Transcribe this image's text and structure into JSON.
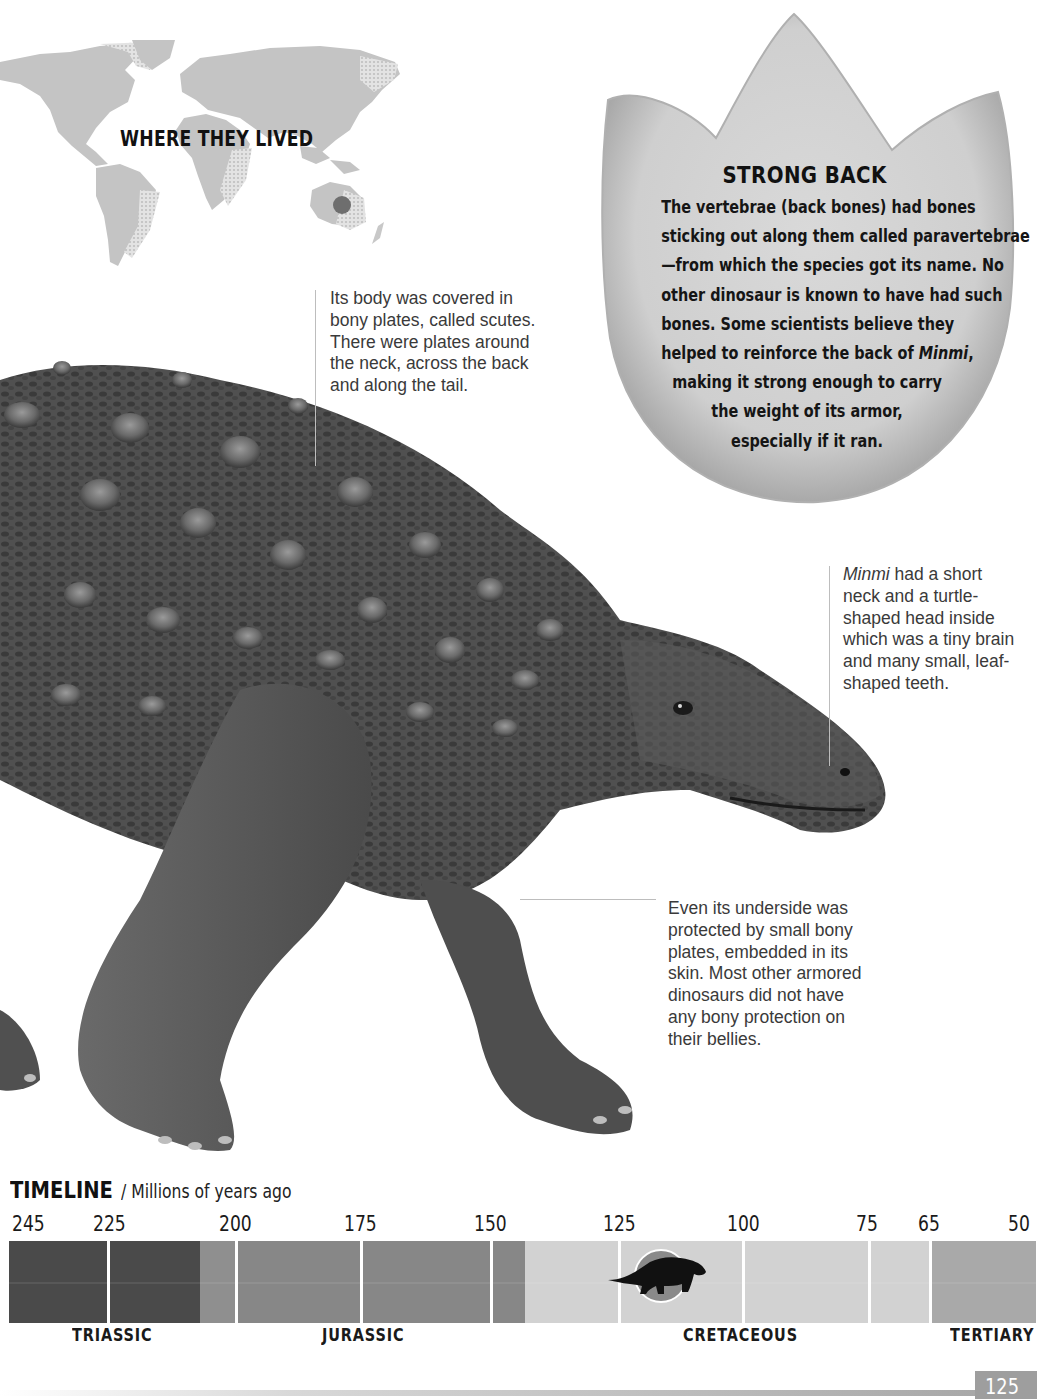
{
  "map": {
    "title": "WHERE THEY LIVED",
    "marker_region": "Australia",
    "marker_color": "#6e6e6e",
    "land_color": "#c4c4c4"
  },
  "strong_back": {
    "title": "STRONG BACK",
    "lines": [
      "The vertebrae (back bones) had bones",
      "sticking out along them called paravertebrae",
      "—from which the species got its name. No",
      "other dinosaur is known to have had such",
      "bones. Some scientists believe they",
      "helped to reinforce the back of ",
      "making it strong enough to carry",
      "the weight of its armor,",
      "especially if it ran."
    ],
    "italic_name": "Minmi",
    "italic_suffix": ","
  },
  "annotations": {
    "scutes": {
      "lines": [
        "Its body was covered in",
        "bony plates, called scutes.",
        "There were plates around",
        "the neck, across the back",
        "and along the tail."
      ]
    },
    "head": {
      "italic_name": "Minmi",
      "lines": [
        " had a short",
        "neck and a turtle-",
        "shaped head inside",
        "which was a tiny brain",
        "and many small, leaf-",
        "shaped teeth."
      ]
    },
    "belly": {
      "lines": [
        "Even its underside was",
        "protected by small bony",
        "plates, embedded in its",
        "skin. Most other armored",
        "dinosaurs did not have",
        "any bony protection on",
        "their bellies."
      ]
    }
  },
  "illustration": {
    "subject": "Minmi paravertebra armored dinosaur",
    "palette": [
      "#3d3d3d",
      "#595959",
      "#8a8a8a",
      "#b5b5b5"
    ]
  },
  "timeline": {
    "title": "TIMELINE",
    "subtitle": "/ Millions of years ago",
    "ticks": [
      {
        "label": "245",
        "x": 12
      },
      {
        "label": "225",
        "x": 93
      },
      {
        "label": "200",
        "x": 219
      },
      {
        "label": "175",
        "x": 344
      },
      {
        "label": "150",
        "x": 474
      },
      {
        "label": "125",
        "x": 603
      },
      {
        "label": "100",
        "x": 727
      },
      {
        "label": "75",
        "x": 856
      },
      {
        "label": "65",
        "x": 918
      },
      {
        "label": "50",
        "x": 1008
      }
    ],
    "periods": [
      {
        "name": "TRIASSIC",
        "label_x": 72,
        "start_x": 0,
        "end_x": 191,
        "color": "#4a4a4a"
      },
      {
        "name": "JURASSIC",
        "label_x": 322,
        "start_x": 191,
        "end_x": 516,
        "color": "#8b8b8b"
      },
      {
        "name": "CRETACEOUS",
        "label_x": 683,
        "start_x": 516,
        "end_x": 922,
        "color": "#d2d2d2"
      },
      {
        "name": "TERTIARY",
        "label_x": 950,
        "start_x": 922,
        "end_x": 1027,
        "color": "#a9a9a9"
      }
    ],
    "segments": [
      {
        "start_x": 0,
        "end_x": 191,
        "color": "#4a4a4a"
      },
      {
        "start_x": 191,
        "end_x": 226,
        "color": "#8f8f8f"
      },
      {
        "start_x": 226,
        "end_x": 516,
        "color": "#878787"
      },
      {
        "start_x": 516,
        "end_x": 922,
        "color": "#d2d2d2"
      },
      {
        "start_x": 922,
        "end_x": 1027,
        "color": "#a9a9a9"
      }
    ],
    "dividers_x": [
      98,
      226,
      351,
      481,
      609,
      733,
      859,
      920
    ],
    "marker": {
      "label": "Minmi",
      "position_mya": "~115",
      "circle_color": "#8a8a8a",
      "silhouette_color": "#111111"
    }
  },
  "footer": {
    "page_number": "125"
  }
}
